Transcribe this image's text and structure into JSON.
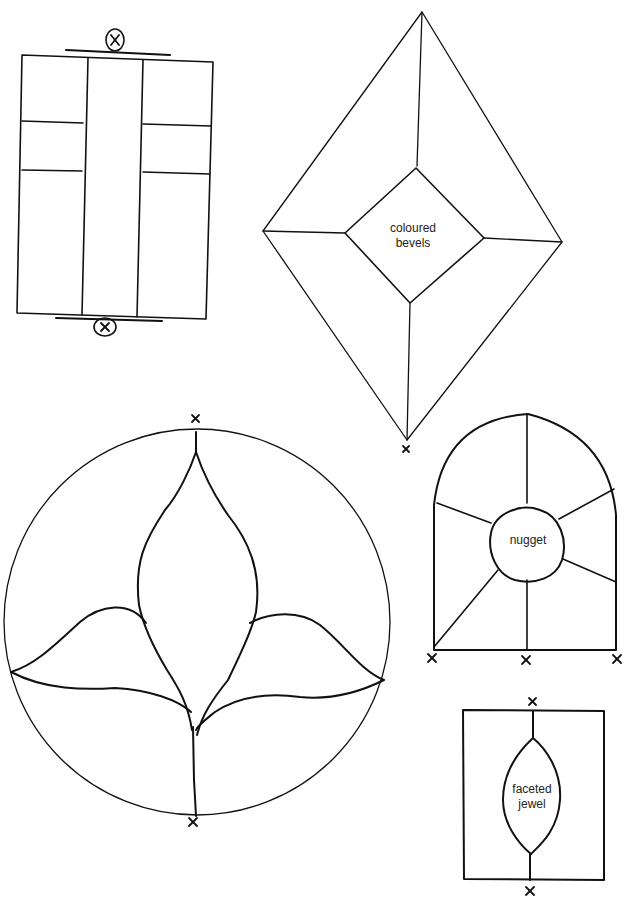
{
  "diagrams": {
    "rectangle_panel": {
      "hanging_marks": [
        "x",
        "x"
      ]
    },
    "diamond_panel": {
      "label_line1": "coloured",
      "label_line2": "bevels",
      "mark": "x"
    },
    "arch_panel": {
      "label": "nugget",
      "marks": [
        "x",
        "x",
        "x"
      ]
    },
    "circle_panel": {
      "marks": [
        "x",
        "x"
      ]
    },
    "jewel_panel": {
      "label_line1": "faceted",
      "label_line2": "jewel",
      "marks": [
        "x",
        "x"
      ]
    }
  },
  "colors": {
    "ink": "#111111",
    "background": "#ffffff"
  }
}
